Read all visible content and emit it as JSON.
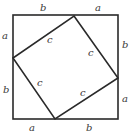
{
  "diagram": {
    "outer_square": {
      "x1": 13,
      "y1": 15,
      "x2": 118,
      "y2": 119
    },
    "inner_square": {
      "points": [
        [
          74,
          16
        ],
        [
          118,
          78
        ],
        [
          55,
          119
        ],
        [
          13,
          58
        ]
      ]
    },
    "labels": {
      "top_left": "b",
      "top_right": "a",
      "left_top": "a",
      "left_bottom": "b",
      "right_top": "b",
      "right_bottom": "a",
      "bottom_left": "a",
      "bottom_right": "b",
      "inner_top_left": "c",
      "inner_top_right": "c",
      "inner_bottom_left": "c",
      "inner_bottom_right": "c"
    },
    "stroke_color": "#2a2a2a",
    "label_color": "#3a3a3a",
    "background": "#ffffff"
  }
}
